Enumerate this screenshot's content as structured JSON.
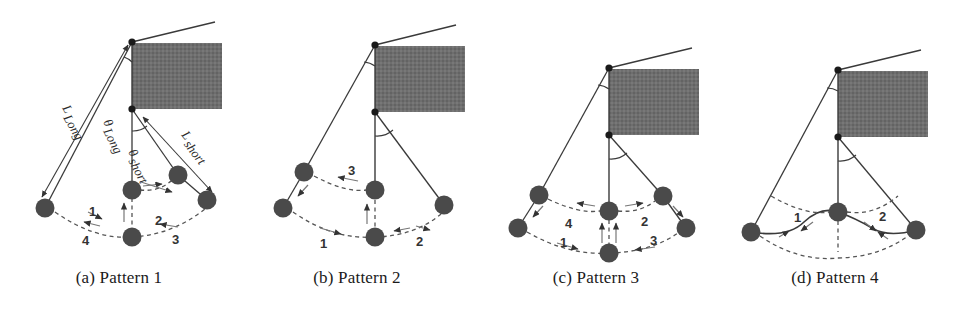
{
  "figure": {
    "type": "scientific-diagram",
    "background": "#ffffff",
    "ball_color": "#4a4a4a",
    "line_color": "#3a3a3a",
    "hatch_color": "#6b6b6b",
    "panel_count": 4
  },
  "panels": [
    {
      "id": "a",
      "caption": "(a) Pattern 1",
      "labels": {
        "l_long": "L",
        "l_long_sub": "Long",
        "theta_long": "θ",
        "theta_long_sub": "Long",
        "l_short": "L",
        "l_short_sub": "short",
        "theta_short": "θ",
        "theta_short_sub": "short"
      },
      "step_numbers": [
        "1",
        "2",
        "3",
        "4"
      ],
      "ball_count": 4
    },
    {
      "id": "b",
      "caption": "(b) Pattern 2",
      "step_numbers": [
        "1",
        "2",
        "3"
      ],
      "ball_count": 5
    },
    {
      "id": "c",
      "caption": "(c) Pattern 3",
      "step_numbers": [
        "1",
        "2",
        "3",
        "4"
      ],
      "ball_count": 6
    },
    {
      "id": "d",
      "caption": "(d) Pattern 4",
      "step_numbers": [
        "1",
        "2"
      ],
      "ball_count": 3
    }
  ]
}
